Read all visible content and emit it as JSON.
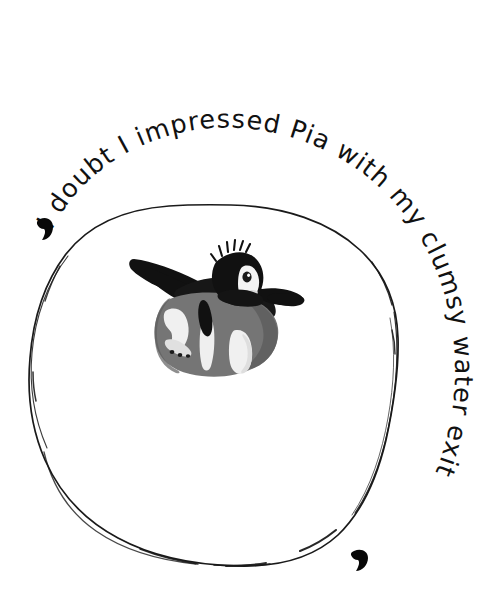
{
  "image": {
    "kind": "illustrated-caption-card",
    "background_color": "#ffffff",
    "width": 504,
    "height": 605
  },
  "caption": {
    "text": "I doubt I impressed Pia with my clumsy water exit",
    "full_text_with_quotes": "‘I doubt I impressed Pia with my clumsy water exit’",
    "layout": "curved along the outside of a hand-drawn circle, reading clockwise from upper-left to lower-right",
    "color": "#111111",
    "style": "handwritten marker lettering",
    "opening_mark": "‘",
    "closing_mark": "’",
    "words": [
      "I",
      "doubt",
      "I",
      "impressed",
      "Pia",
      "with",
      "my",
      "clumsy",
      "water",
      "exit"
    ]
  },
  "frame": {
    "name": "hand-drawn circle",
    "stroke_color": "#1a1a1a",
    "fill_color": "#ffffff",
    "center_x": 212,
    "center_y": 385,
    "radius_x": 184,
    "radius_y": 180,
    "stroke_width": 1.6,
    "style": "wobbly ink outline with doubled-up overlapping strokes"
  },
  "subject": {
    "name": "penguin",
    "pose": "belly-down, flippers spread, head turned to the right",
    "center_x": 212,
    "center_y": 315,
    "colors": {
      "body_gray": "#757575",
      "body_gray_dark": "#5e5e5e",
      "black": "#111111",
      "white": "#f2f2f2",
      "off_white": "#e4e4e4"
    },
    "parts": [
      "head",
      "face-patch",
      "eye",
      "beak",
      "crest-tuft",
      "left-flipper",
      "right-flipper",
      "back",
      "belly",
      "left-foot",
      "right-foot",
      "tail"
    ]
  }
}
